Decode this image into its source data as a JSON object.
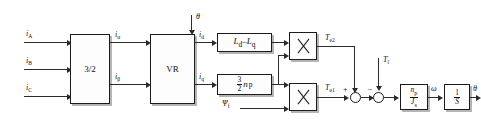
{
  "diagram": {
    "type": "control-block-diagram"
  },
  "inputs": {
    "phase_a": "i",
    "phase_a_sub": "A",
    "phase_b": "i",
    "phase_b_sub": "B",
    "phase_c": "i",
    "phase_c_sub": "C",
    "theta_in": "θ",
    "load_torque": "T",
    "load_torque_sub": "l",
    "flux": "Ψ",
    "flux_sub": "f"
  },
  "blocks": {
    "clarke": {
      "label": "3/2",
      "name": "3-phase to 2-phase transform"
    },
    "park": {
      "label": "VR",
      "name": "vector rotator"
    },
    "inductance_diff": {
      "label": "L",
      "sub1": "d",
      "minus": "–",
      "label2": "L",
      "sub2": "q"
    },
    "torque_const": {
      "num": "3",
      "den": "2",
      "sym": "n",
      "sub": "p"
    },
    "inertia": {
      "num": "n",
      "num_sub": "p",
      "den": "J",
      "den_sub": "s"
    },
    "integrator": {
      "num": "1",
      "den": "S"
    },
    "mult_top": {
      "label": "×",
      "name": "multiplier"
    },
    "mult_bottom": {
      "label": "×",
      "name": "multiplier"
    }
  },
  "signals": {
    "i_alpha": "i",
    "i_alpha_sub": "α",
    "i_beta": "i",
    "i_beta_sub": "β",
    "i_d": "i",
    "i_d_sub": "d",
    "i_q": "i",
    "i_q_sub": "q",
    "te2": "T",
    "te2_sub": "e2",
    "te1": "T",
    "te1_sub": "e1",
    "omega": "ω",
    "theta_out": "θ"
  },
  "summing": {
    "junction1_plus": "+",
    "junction2_minus": "–"
  }
}
